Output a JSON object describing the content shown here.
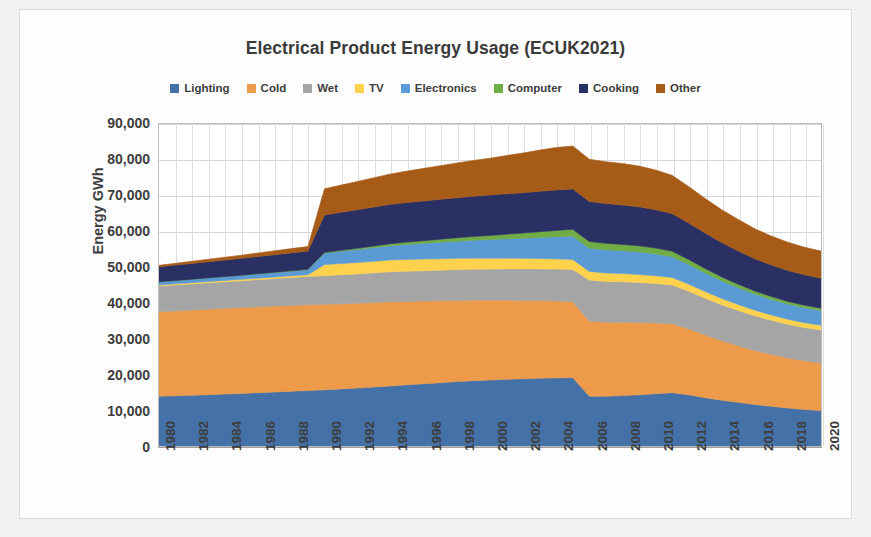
{
  "chart_data": {
    "type": "area",
    "stacked": true,
    "title": "Electrical Product Energy Usage (ECUK2021)",
    "xlabel": "",
    "ylabel": "Energy GWh",
    "ylim": [
      0,
      90000
    ],
    "ytick_labels": [
      "90,000",
      "80,000",
      "70,000",
      "60,000",
      "50,000",
      "40,000",
      "30,000",
      "20,000",
      "10,000",
      "0"
    ],
    "ytick_values": [
      90000,
      80000,
      70000,
      60000,
      50000,
      40000,
      30000,
      20000,
      10000,
      0
    ],
    "grid": true,
    "legend_position": "top",
    "xtick_labels": [
      "1980",
      "1982",
      "1984",
      "1986",
      "1988",
      "1990",
      "1992",
      "1994",
      "1996",
      "1998",
      "2000",
      "2002",
      "2004",
      "2006",
      "2008",
      "2010",
      "2012",
      "2014",
      "2016",
      "2018",
      "2020"
    ],
    "x": [
      1980,
      1981,
      1982,
      1983,
      1984,
      1985,
      1986,
      1987,
      1988,
      1989,
      1990,
      1991,
      1992,
      1993,
      1994,
      1995,
      1996,
      1997,
      1998,
      1999,
      2000,
      2001,
      2002,
      2003,
      2004,
      2005,
      2006,
      2007,
      2008,
      2009,
      2010,
      2011,
      2012,
      2013,
      2014,
      2015,
      2016,
      2017,
      2018,
      2019,
      2020
    ],
    "series": [
      {
        "name": "Lighting",
        "color": "#4472a8",
        "values": [
          13900,
          14050,
          14200,
          14350,
          14500,
          14700,
          14900,
          15100,
          15300,
          15500,
          15700,
          15950,
          16200,
          16500,
          16800,
          17100,
          17400,
          17700,
          18000,
          18250,
          18450,
          18650,
          18800,
          18950,
          19050,
          19100,
          13900,
          13900,
          14100,
          14300,
          14600,
          14900,
          14300,
          13500,
          12800,
          12200,
          11600,
          11100,
          10600,
          10200,
          9900
        ]
      },
      {
        "name": "Cold",
        "color": "#ed9b4a",
        "values": [
          23600,
          23700,
          23800,
          23900,
          24000,
          24000,
          24000,
          24000,
          24000,
          24000,
          23900,
          23800,
          23700,
          23600,
          23500,
          23300,
          23100,
          22900,
          22700,
          22500,
          22300,
          22100,
          21900,
          21700,
          21500,
          21300,
          21000,
          20700,
          20500,
          20200,
          19800,
          19300,
          18500,
          17500,
          16600,
          15800,
          15100,
          14500,
          14000,
          13600,
          13300
        ]
      },
      {
        "name": "Wet",
        "color": "#a5a5a5",
        "values": [
          7200,
          7250,
          7300,
          7350,
          7400,
          7500,
          7600,
          7700,
          7800,
          7900,
          8000,
          8100,
          8200,
          8300,
          8400,
          8450,
          8500,
          8550,
          8600,
          8650,
          8700,
          8750,
          8800,
          8850,
          8900,
          8950,
          11500,
          11400,
          11300,
          11200,
          11000,
          10800,
          10500,
          10300,
          10100,
          9900,
          9700,
          9550,
          9400,
          9300,
          9200
        ]
      },
      {
        "name": "TV",
        "color": "#ffd24d",
        "values": [
          300,
          320,
          340,
          360,
          380,
          400,
          420,
          440,
          460,
          480,
          3100,
          3150,
          3200,
          3250,
          3300,
          3300,
          3250,
          3200,
          3150,
          3100,
          3050,
          3000,
          2950,
          2900,
          2850,
          2800,
          2400,
          2350,
          2300,
          2250,
          2200,
          2100,
          1950,
          1850,
          1750,
          1650,
          1550,
          1480,
          1420,
          1380,
          1350
        ]
      },
      {
        "name": "Electronics",
        "color": "#5b9bd5",
        "values": [
          900,
          950,
          1000,
          1050,
          1100,
          1150,
          1200,
          1250,
          1300,
          1350,
          3200,
          3400,
          3600,
          3800,
          4000,
          4200,
          4400,
          4600,
          4800,
          5000,
          5200,
          5400,
          5600,
          5900,
          6200,
          6500,
          6500,
          6500,
          6400,
          6300,
          6100,
          5800,
          5500,
          5200,
          4900,
          4700,
          4500,
          4350,
          4250,
          4180,
          4100
        ]
      },
      {
        "name": "Computer",
        "color": "#70ad47",
        "values": [
          0,
          0,
          0,
          0,
          0,
          0,
          50,
          80,
          110,
          140,
          200,
          280,
          360,
          450,
          550,
          650,
          750,
          850,
          950,
          1050,
          1150,
          1300,
          1450,
          1600,
          1750,
          1900,
          1850,
          1800,
          1750,
          1700,
          1650,
          1550,
          1400,
          1250,
          1100,
          980,
          880,
          800,
          740,
          700,
          670
        ]
      },
      {
        "name": "Cooking",
        "color": "#2a3064",
        "values": [
          4200,
          4300,
          4400,
          4500,
          4600,
          4700,
          4800,
          4900,
          5000,
          5100,
          10500,
          10650,
          10800,
          10900,
          11000,
          11050,
          11100,
          11150,
          11200,
          11250,
          11300,
          11300,
          11300,
          11300,
          11300,
          11300,
          11200,
          11100,
          11000,
          10900,
          10700,
          10500,
          10200,
          9900,
          9600,
          9300,
          9000,
          8800,
          8650,
          8500,
          8400
        ]
      },
      {
        "name": "Other",
        "color": "#a65c17",
        "values": [
          400,
          500,
          600,
          700,
          800,
          900,
          1000,
          1100,
          1200,
          1300,
          7300,
          7600,
          7900,
          8200,
          8500,
          8800,
          9100,
          9400,
          9700,
          10000,
          10300,
          10700,
          11100,
          11500,
          11900,
          12000,
          11800,
          11700,
          11600,
          11400,
          11100,
          10700,
          10200,
          9700,
          9200,
          8800,
          8400,
          8100,
          7900,
          7700,
          7550
        ]
      }
    ]
  },
  "legend": {
    "items": [
      {
        "label": "Lighting",
        "color": "#4472a8"
      },
      {
        "label": "Cold",
        "color": "#ed9b4a"
      },
      {
        "label": "Wet",
        "color": "#a5a5a5"
      },
      {
        "label": "TV",
        "color": "#ffd24d"
      },
      {
        "label": "Electronics",
        "color": "#5b9bd5"
      },
      {
        "label": "Computer",
        "color": "#70ad47"
      },
      {
        "label": "Cooking",
        "color": "#2a3064"
      },
      {
        "label": "Other",
        "color": "#a65c17"
      }
    ]
  }
}
